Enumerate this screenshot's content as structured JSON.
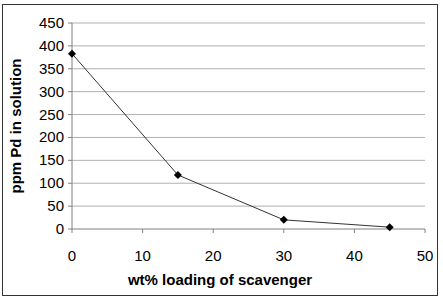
{
  "chart_data": {
    "type": "line",
    "title": "",
    "xlabel": "wt% loading of scavenger",
    "ylabel": "ppm Pd in solution",
    "x": [
      0,
      15,
      30,
      45
    ],
    "series": [
      {
        "name": "ppm Pd in solution",
        "values": [
          383,
          118,
          20,
          4
        ],
        "color": "#000000",
        "marker": "diamond"
      }
    ],
    "xlim": [
      0,
      50
    ],
    "ylim": [
      0,
      450
    ],
    "xticks": [
      0,
      10,
      20,
      30,
      40,
      50
    ],
    "yticks": [
      0,
      50,
      100,
      150,
      200,
      250,
      300,
      350,
      400,
      450
    ],
    "grid": {
      "horizontal": true,
      "vertical": false,
      "color": "#b0b0b0"
    },
    "legend": null
  }
}
